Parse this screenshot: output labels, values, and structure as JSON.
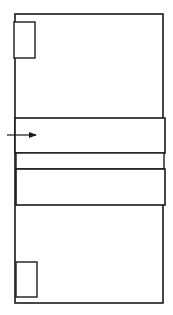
{
  "diagram": {
    "title": "",
    "colors": {
      "stroke": "#1a1a1a",
      "background": "#ffffff",
      "fill": "#ffffff"
    },
    "outer_frame": {
      "x": 15,
      "y": 14,
      "width": 148,
      "height": 289
    },
    "top_small_rect": {
      "x": 14,
      "y": 22,
      "width": 21,
      "height": 36
    },
    "bands": [
      {
        "name": "band-upper",
        "x": 15,
        "y": 118,
        "width": 150,
        "height": 35
      },
      {
        "name": "band-gap",
        "x": 16,
        "y": 153,
        "width": 148,
        "height": 16
      },
      {
        "name": "band-lower",
        "x": 16,
        "y": 169,
        "width": 149,
        "height": 36
      }
    ],
    "bottom_small_rect": {
      "x": 16,
      "y": 262,
      "width": 21,
      "height": 35
    },
    "arrow": {
      "x1": 7,
      "y1": 135,
      "x2": 36,
      "y2": 135,
      "direction": "right"
    },
    "labels": []
  }
}
